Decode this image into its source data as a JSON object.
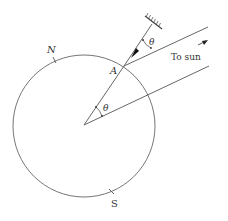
{
  "diagram": {
    "type": "geometry",
    "labels": {
      "north": "N",
      "south": "S",
      "point_a": "A",
      "theta_top": "θ",
      "theta_center": "θ",
      "to_sun": "To sun"
    },
    "colors": {
      "line": "#555555",
      "text": "#333333",
      "background": "#ffffff"
    }
  }
}
